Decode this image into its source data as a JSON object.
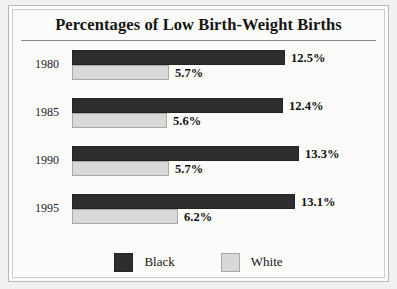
{
  "chart_data": {
    "type": "bar",
    "orientation": "horizontal",
    "title": "Percentages of Low Birth-Weight Births",
    "xlabel": "",
    "ylabel": "",
    "categories": [
      "1980",
      "1985",
      "1990",
      "1995"
    ],
    "series": [
      {
        "name": "Black",
        "color": "#2e2e2e",
        "values": [
          12.5,
          12.4,
          13.3,
          13.1
        ],
        "labels": [
          "12.5%",
          "12.4%",
          "13.3%",
          "13.1%"
        ]
      },
      {
        "name": "White",
        "color": "#d8d8d6",
        "values": [
          5.7,
          5.6,
          5.7,
          6.2
        ],
        "labels": [
          "5.7%",
          "5.6%",
          "5.7%",
          "6.2%"
        ]
      }
    ],
    "xlim": [
      0,
      14.5
    ],
    "grid": false,
    "legend_position": "bottom"
  },
  "legend": {
    "entries": [
      {
        "label": "Black",
        "swatch": "black"
      },
      {
        "label": "White",
        "swatch": "white"
      }
    ]
  }
}
